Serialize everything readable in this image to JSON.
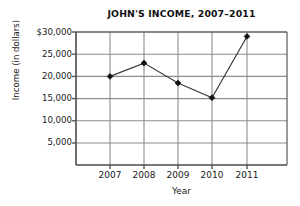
{
  "chart_data": {
    "type": "line",
    "title": "JOHN'S INCOME, 2007–2011",
    "xlabel": "Year",
    "ylabel": "Income (in dollars)",
    "categories": [
      "2007",
      "2008",
      "2009",
      "2010",
      "2011"
    ],
    "values": [
      20000,
      23000,
      18500,
      15200,
      29000
    ],
    "series": [
      {
        "name": "John's Income",
        "values": [
          20000,
          23000,
          18500,
          15200,
          29000
        ]
      }
    ],
    "ylim": [
      0,
      30000
    ],
    "ytick_labels": [
      "$30,000",
      "25,000",
      "20,000",
      "15,000",
      "10,000",
      "5,000"
    ],
    "ytick_values": [
      30000,
      25000,
      20000,
      15000,
      10000,
      5000
    ],
    "xtick_labels": [
      "2007",
      "2008",
      "2009",
      "2010",
      "2011"
    ],
    "grid": true,
    "legend": "none",
    "marker": "filled-diamond",
    "line_color": "#3a3a3a",
    "marker_color": "#111111",
    "grid_color": "#8c8c8c",
    "background": "#ffffff"
  }
}
